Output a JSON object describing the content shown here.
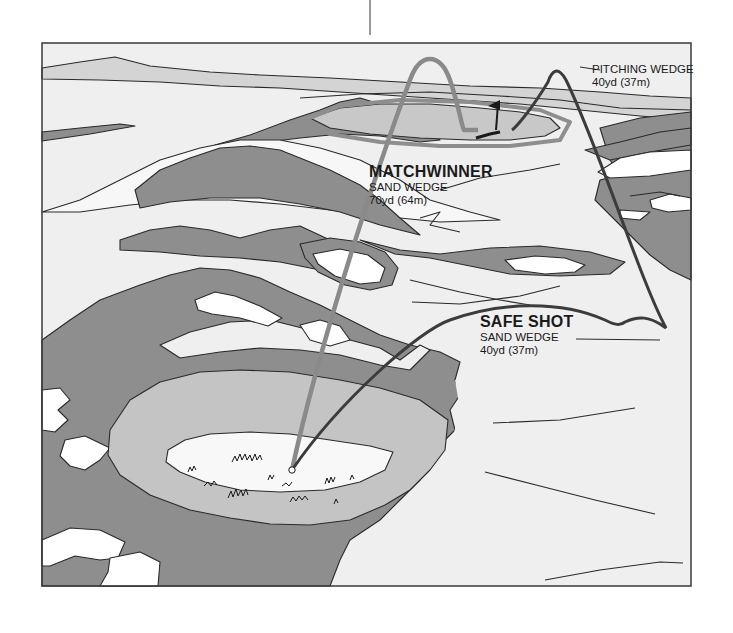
{
  "figure": {
    "colors": {
      "frame": "#3a3a3a",
      "background_fairway": "#efefef",
      "light_grey": "#d2d2d2",
      "mid_grey": "#c4c4c4",
      "dark_grey": "#8e8e8e",
      "white_sand": "#ffffff",
      "outline": "#2a2a2a",
      "matchwinner_path": "#8a8a8a",
      "safe_shot_path": "#3c3c3c",
      "pitching_path": "#3c3c3c"
    }
  },
  "labels": {
    "matchwinner": {
      "title": "MATCHWINNER",
      "club": "SAND WEDGE",
      "distance": "70yd (64m)"
    },
    "safe_shot": {
      "title": "SAFE SHOT",
      "club": "SAND WEDGE",
      "distance": "40yd (37m)"
    },
    "pitching": {
      "club": "PITCHING WEDGE",
      "distance": "40yd (37m)"
    }
  },
  "paths": [
    {
      "name": "matchwinner-shot",
      "description": "light grey arc from ball in bunker, high over hazards, landing beside pin"
    },
    {
      "name": "safe-shot",
      "description": "dark arc from ball to safe fairway area on right"
    },
    {
      "name": "pitching-wedge-shot",
      "description": "dark arc from safe area up to the green near the pin"
    }
  ]
}
